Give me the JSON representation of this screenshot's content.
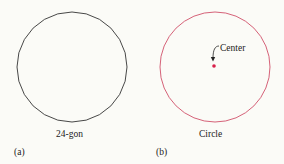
{
  "panels": [
    {
      "tag": "(a)",
      "caption": "24-gon",
      "shape": "polygon",
      "sides": 24,
      "stroke_color": "#333333"
    },
    {
      "tag": "(b)",
      "caption": "Circle",
      "shape": "circle",
      "stroke_color": "#d0506a",
      "center_label": "Center",
      "center_dot_color": "#d8204a"
    }
  ]
}
